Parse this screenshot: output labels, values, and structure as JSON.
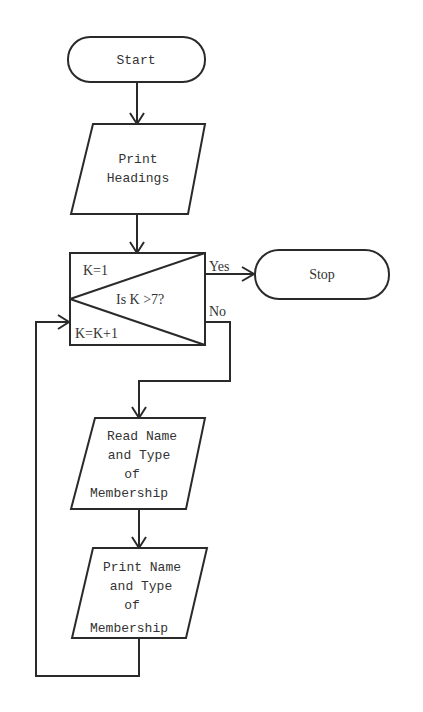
{
  "flowchart": {
    "start": {
      "label": "Start"
    },
    "print_headings": {
      "line1": "Print",
      "line2": "Headings"
    },
    "decision": {
      "init": "K=1",
      "question": "Is K >7?",
      "increment": "K=K+1",
      "yes_label": "Yes",
      "no_label": "No"
    },
    "stop": {
      "label": "Stop"
    },
    "read_name": {
      "line1": "Read Name",
      "line2": "and Type",
      "line3": "of",
      "line4": "Membership"
    },
    "print_name": {
      "line1": "Print Name",
      "line2": "and Type",
      "line3": "of",
      "line4": "Membership"
    }
  }
}
